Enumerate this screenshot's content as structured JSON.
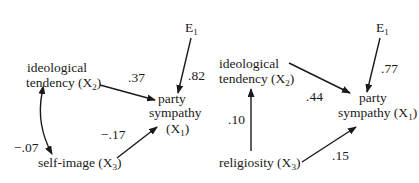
{
  "diagrams": [
    {
      "id": "left",
      "nodes": {
        "error": {
          "label": "E",
          "sub": "1"
        },
        "x2": {
          "line1": "ideological",
          "line2_pre": "tendency (X",
          "sub": "2",
          "line2_post": ")"
        },
        "x1": {
          "line1": "party",
          "line2": "sympathy",
          "line3_pre": "(X",
          "sub": "1",
          "line3_post": ")"
        },
        "x3": {
          "pre": "self-image (X",
          "sub": "3",
          "post": ")"
        }
      },
      "paths": {
        "x2_to_x1": ".37",
        "e_to_x1": ".82",
        "x3_to_x1": "−.17",
        "x2_x3_correlation": "−.07"
      }
    },
    {
      "id": "right",
      "nodes": {
        "error": {
          "label": "E",
          "sub": "1"
        },
        "x2": {
          "line1": "ideological",
          "line2_pre": "tendency (X",
          "sub": "2",
          "line2_post": ")"
        },
        "x1": {
          "line1": "party",
          "line2_pre": "sympathy (X",
          "sub": "1",
          "line2_post": ")"
        },
        "x3": {
          "pre": "religiosity (X",
          "sub": "3",
          "post": ")"
        }
      },
      "paths": {
        "x2_to_x1": ".44",
        "e_to_x1": ".77",
        "x3_to_x1": ".15",
        "x3_to_x2": ".10"
      }
    }
  ],
  "colors": {
    "ink": "#1a1a1a",
    "background": "#ffffff"
  }
}
